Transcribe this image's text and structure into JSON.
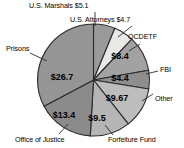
{
  "chart_data": {
    "type": "pie",
    "title": "",
    "units": "billions of dollars",
    "center": {
      "x": 93.5,
      "y": 80
    },
    "radius": 56,
    "start_angle_deg": -90,
    "direction": "clockwise",
    "total": 82.07,
    "categories": [
      "U.S. Marshals",
      "U.S. Attorneys",
      "OCDETF",
      "FBI",
      "Other",
      "Forfeiture Fund",
      "Office of Justice",
      "Prisons"
    ],
    "values": [
      5.1,
      4.7,
      8.4,
      4.4,
      9.67,
      9.5,
      13.4,
      26.7
    ],
    "value_labels": [
      "$5.1",
      "$4.7",
      "$8.4",
      "$4.4",
      "$9.67",
      "$9.5",
      "$13.4",
      "$26.7"
    ],
    "slices": [
      {
        "name": "U.S. Marshals",
        "value": 5.1,
        "value_label": "$5.1",
        "name_label": "U.S. Marshals $5.1",
        "color": "#9a9a9a",
        "start_deg": -90,
        "end_deg": -67.6,
        "label_inside": false
      },
      {
        "name": "U.S. Attorneys",
        "value": 4.7,
        "value_label": "$4.7",
        "name_label": "U.S. Attorneys $4.7",
        "color": "#e8e8e6",
        "start_deg": -67.6,
        "end_deg": -46.9,
        "label_inside": false
      },
      {
        "name": "OCDETF",
        "value": 8.4,
        "value_label": "$8.4",
        "name_label": "OCDETF",
        "color": "#a2a2a2",
        "start_deg": -46.9,
        "end_deg": -10.1,
        "label_inside": true,
        "label_x": 120,
        "label_y": 59
      },
      {
        "name": "FBI",
        "value": 4.4,
        "value_label": "$4.4",
        "name_label": "FBI",
        "color": "#8e8e8e",
        "start_deg": -10.1,
        "end_deg": 9.2,
        "label_inside": true,
        "label_x": 120,
        "label_y": 81
      },
      {
        "name": "Other",
        "value": 9.67,
        "value_label": "$9.67",
        "name_label": "Other",
        "color": "#bdbdbd",
        "start_deg": 9.2,
        "end_deg": 51.6,
        "label_inside": true,
        "label_x": 117,
        "label_y": 101
      },
      {
        "name": "Forfeiture Fund",
        "value": 9.5,
        "value_label": "$9.5",
        "name_label": "Forfeiture Fund",
        "color": "#b5b5b5",
        "start_deg": 51.6,
        "end_deg": 93.3,
        "label_inside": true,
        "label_x": 97,
        "label_y": 121
      },
      {
        "name": "Office of Justice",
        "value": 13.4,
        "value_label": "$13.4",
        "name_label": "Office of Justice",
        "color": "#8b8b8b",
        "start_deg": 93.3,
        "end_deg": 152.1,
        "label_inside": true,
        "label_x": 64,
        "label_y": 118
      },
      {
        "name": "Prisons",
        "value": 26.7,
        "value_label": "$26.7",
        "name_label": "Prisons",
        "color": "#959595",
        "start_deg": 152.1,
        "end_deg": 270,
        "label_inside": true,
        "label_x": 62,
        "label_y": 80
      }
    ],
    "callouts": [
      {
        "name": "us-marshals",
        "text": "U.S. Marshals $5.1",
        "text_x": 29,
        "text_y": 2,
        "line": [
          [
            95,
            12
          ],
          [
            95,
            26
          ]
        ]
      },
      {
        "name": "us-attorneys",
        "text": "U.S. Attorneys $4.7",
        "text_x": 70,
        "text_y": 16,
        "line": [
          [
            132,
            26
          ],
          [
            118,
            37
          ]
        ]
      },
      {
        "name": "ocdetf",
        "text": "OCDETF",
        "text_x": 128,
        "text_y": 33,
        "line": [
          [
            140,
            44
          ],
          [
            129,
            51
          ]
        ]
      },
      {
        "name": "fbi",
        "text": "FBI",
        "text_x": 160,
        "text_y": 66,
        "line": [
          [
            158,
            71
          ],
          [
            146,
            74
          ]
        ]
      },
      {
        "name": "other",
        "text": "Other",
        "text_x": 155,
        "text_y": 95,
        "line": [
          [
            153,
            94
          ],
          [
            142,
            101
          ]
        ]
      },
      {
        "name": "forfeiture-fund",
        "text": "Forfeiture Fund",
        "text_x": 108,
        "text_y": 136,
        "line": [
          [
            113,
            135
          ],
          [
            105,
            125
          ]
        ]
      },
      {
        "name": "office-of-justice",
        "text": "Office of Justice",
        "text_x": 15,
        "text_y": 136,
        "line": [
          [
            59,
            134
          ],
          [
            68,
            124
          ]
        ]
      },
      {
        "name": "prisons",
        "text": "Prisons",
        "text_x": 6,
        "text_y": 45,
        "line": [
          [
            30,
            53
          ],
          [
            47,
            61
          ]
        ]
      }
    ],
    "xlabel": "",
    "ylabel": "",
    "legend": "none",
    "grid": false
  },
  "colors": {
    "background": "#ffffff",
    "outline": "#2b2b2b",
    "text": "#000000",
    "leader_line": "#2b2b2b"
  }
}
